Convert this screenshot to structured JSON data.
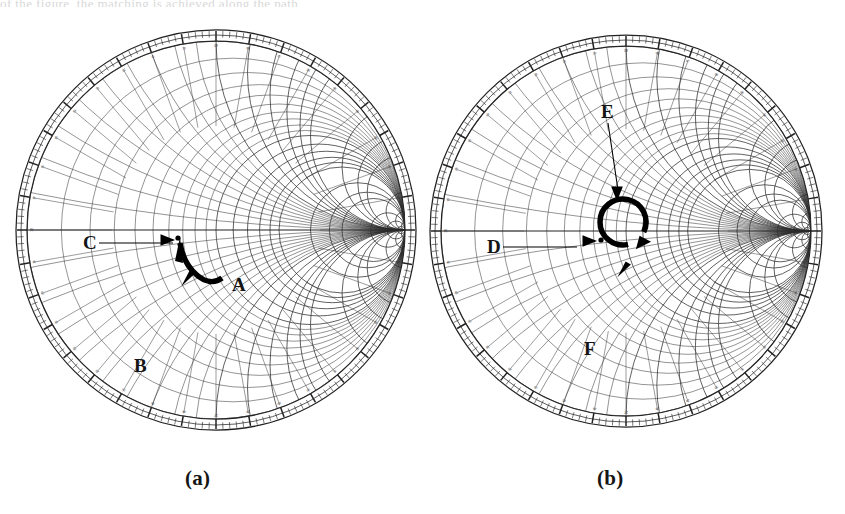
{
  "figure": {
    "type": "smith-chart-pair",
    "bleed_text_top": "of the figure, the matching is achieved along the path",
    "captions": [
      {
        "id": "a",
        "text": "(a)"
      },
      {
        "id": "b",
        "text": "(b)"
      }
    ]
  },
  "charts": [
    {
      "id": "a",
      "caption": "(a)",
      "center": {
        "x": 216,
        "y": 230
      },
      "radius": 200,
      "labels": [
        {
          "name": "label-c",
          "text": "C",
          "x": 83,
          "y": 249,
          "leader": true
        },
        {
          "name": "label-b",
          "text": "B",
          "x": 134,
          "y": 372,
          "leader": false
        },
        {
          "name": "label-a",
          "text": "A",
          "x": 232,
          "y": 291,
          "leader": false
        }
      ],
      "markers": [
        {
          "name": "point-marker",
          "x": 178,
          "y": 238
        }
      ],
      "annotations": [
        {
          "name": "arrowhead-right-on-axis",
          "type": "triangle",
          "x": 168,
          "y": 240,
          "dir": "right"
        },
        {
          "name": "matching-path-arc",
          "type": "thick-arc",
          "from": {
            "x": 180,
            "y": 243
          },
          "to": {
            "x": 222,
            "y": 278
          }
        },
        {
          "name": "arrowhead-down-left",
          "type": "triangle",
          "x": 187,
          "y": 279,
          "dir": "down-left"
        }
      ]
    },
    {
      "id": "b",
      "caption": "(b)",
      "center": {
        "x": 626,
        "y": 231
      },
      "radius": 196,
      "labels": [
        {
          "name": "label-e",
          "text": "E",
          "x": 601,
          "y": 118,
          "leader": true
        },
        {
          "name": "label-d",
          "text": "D",
          "x": 487,
          "y": 253,
          "leader": true
        },
        {
          "name": "label-f",
          "text": "F",
          "x": 584,
          "y": 355,
          "leader": false
        }
      ],
      "markers": [
        {
          "name": "point-marker",
          "x": 601,
          "y": 240
        }
      ],
      "annotations": [
        {
          "name": "arrowhead-right-on-axis",
          "type": "triangle",
          "x": 590,
          "y": 241,
          "dir": "right"
        },
        {
          "name": "constant-swr-loop",
          "type": "thick-open-circle",
          "cx": 623,
          "cy": 222,
          "r": 23
        },
        {
          "name": "arrowhead-down-from-e",
          "type": "triangle",
          "x": 617,
          "y": 194,
          "dir": "down"
        },
        {
          "name": "arrowhead-down-left-to-f",
          "type": "triangle",
          "x": 623,
          "y": 270,
          "dir": "down-left"
        }
      ]
    }
  ],
  "grid": {
    "resistance_circles": [
      0.1,
      0.2,
      0.3,
      0.4,
      0.5,
      0.6,
      0.7,
      0.8,
      0.9,
      1.0,
      1.2,
      1.4,
      1.6,
      1.8,
      2.0,
      3.0,
      4.0,
      5.0,
      10.0,
      20.0,
      50.0
    ],
    "reactance_arcs": [
      0.1,
      0.2,
      0.3,
      0.4,
      0.5,
      0.6,
      0.7,
      0.8,
      0.9,
      1.0,
      1.2,
      1.4,
      1.6,
      1.8,
      2.0,
      3.0,
      4.0,
      5.0,
      10.0,
      20.0,
      50.0
    ],
    "outer_scale": "wavelengths-toward-generator",
    "angle_tick_step_degrees": 2,
    "angle_label_step_degrees": 10
  },
  "colors": {
    "background": "#ffffff",
    "grid": "#2c2c2c",
    "ink": "#000000",
    "label": "#141414"
  }
}
